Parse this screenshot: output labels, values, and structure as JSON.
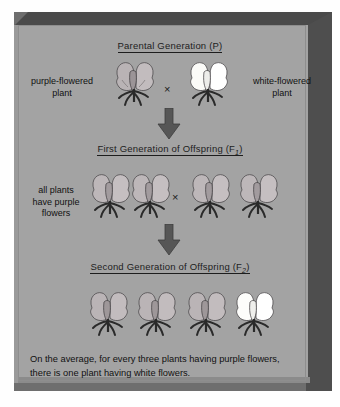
{
  "figure": {
    "title_parental": "Parental Generation (P)",
    "title_f1_prefix": "First Generation of Offspring (F",
    "title_f1_sub": "1",
    "title_f1_suffix": ")",
    "title_f2_prefix": "Second Generation of Offspring (F",
    "title_f2_sub": "2",
    "title_f2_suffix": ")",
    "cross_symbol": "×",
    "labels": {
      "parent_left_line1": "purple-flowered",
      "parent_left_line2": "plant",
      "parent_right_line1": "white-flowered",
      "parent_right_line2": "plant",
      "f1_line1": "all plants",
      "f1_line2": "have purple",
      "f1_line3": "flowers"
    },
    "caption_line1": "On the average, for every three plants having purple flowers,",
    "caption_line2": "there is one plant having white flowers.",
    "colors": {
      "panel_background": "#a3a3a3",
      "bevel_dark": "#4a4a4a",
      "text": "#1d1d1d",
      "purple_flower": "#b9b3b5",
      "white_flower": "#fbfbf8",
      "stem": "#2a2a2a",
      "arrow": "#555555"
    },
    "generations": {
      "parental": [
        {
          "name": "purple-flowered-parent",
          "phenotype": "purple"
        },
        {
          "name": "white-flowered-parent",
          "phenotype": "white"
        }
      ],
      "f1": [
        {
          "name": "f1-plant-1",
          "phenotype": "purple"
        },
        {
          "name": "f1-plant-2",
          "phenotype": "purple"
        },
        {
          "name": "f1-plant-3",
          "phenotype": "purple"
        },
        {
          "name": "f1-plant-4",
          "phenotype": "purple"
        }
      ],
      "f2": [
        {
          "name": "f2-plant-1",
          "phenotype": "purple"
        },
        {
          "name": "f2-plant-2",
          "phenotype": "purple"
        },
        {
          "name": "f2-plant-3",
          "phenotype": "purple"
        },
        {
          "name": "f2-plant-4",
          "phenotype": "white"
        }
      ]
    },
    "ratio": {
      "purple": 3,
      "white": 1
    }
  }
}
